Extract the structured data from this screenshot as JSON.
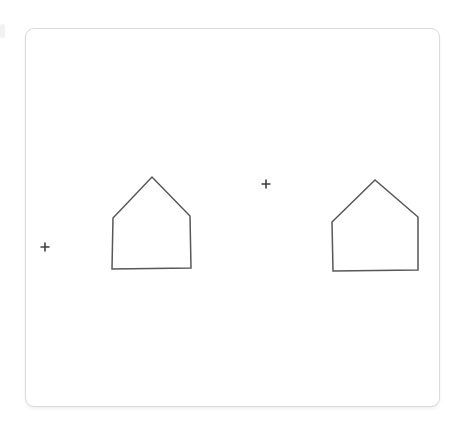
{
  "canvas": {
    "background_color": "#ffffff",
    "card": {
      "x": 25,
      "y": 28,
      "width": 415,
      "height": 379,
      "corner_radius": 9,
      "border_color": "#d9dadb",
      "fill_color": "#ffffff"
    },
    "shape_stroke_color": "#575757",
    "shape_stroke_width": 1.5,
    "marker_color": "#3f3f3f",
    "marker_stroke_width": 1.6,
    "shapes": [
      {
        "name": "house-shape-left",
        "type": "pentagon-house-outline",
        "points": [
          [
            112,
            269
          ],
          [
            113,
            218
          ],
          [
            152,
            177
          ],
          [
            190,
            216
          ],
          [
            191,
            268
          ]
        ]
      },
      {
        "name": "house-shape-right",
        "type": "pentagon-house-outline",
        "points": [
          [
            333,
            271
          ],
          [
            332,
            222
          ],
          [
            375,
            180
          ],
          [
            418,
            217
          ],
          [
            418,
            270
          ]
        ]
      }
    ],
    "markers": [
      {
        "name": "plus-marker-left",
        "type": "plus",
        "x": 45,
        "y": 247,
        "size": 9
      },
      {
        "name": "plus-marker-center",
        "type": "plus",
        "x": 266,
        "y": 184,
        "size": 9
      }
    ]
  }
}
